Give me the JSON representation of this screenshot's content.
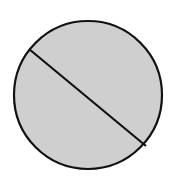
{
  "diagram": {
    "shape": "circle-divided-by-chord",
    "circle": {
      "cx": 88,
      "cy": 95,
      "r": 74,
      "fill": "#cfcfcf",
      "stroke": "#111111",
      "stroke_width": 2.2
    },
    "chord": {
      "x1": 29,
      "y1": 49,
      "x2": 146,
      "y2": 146,
      "stroke": "#111111",
      "stroke_width": 2.2
    }
  }
}
